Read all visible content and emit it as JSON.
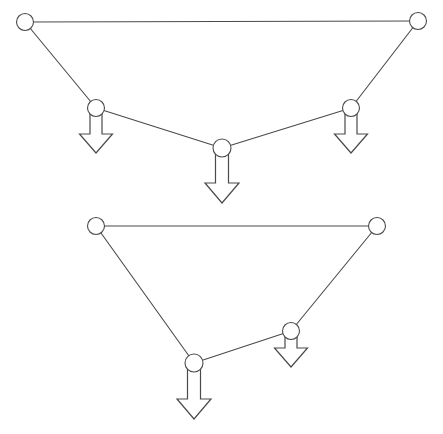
{
  "figure": {
    "background_color": "#ffffff",
    "line_color": "#4a4a4a",
    "joint_fill_color": "#ffffff",
    "arrow_fill_color": "#ffffff",
    "line_width": 1.1,
    "joint_radius": 8.5,
    "canvas": {
      "width": 443,
      "height": 434
    }
  },
  "structures": [
    {
      "name": "upper-truss",
      "label": "Upper truss",
      "joints": [
        {
          "id": "u1",
          "name": "upper-joint-top-left",
          "x": 25,
          "y": 22,
          "r": 8.5,
          "loaded": false
        },
        {
          "id": "u2",
          "name": "upper-joint-left",
          "x": 96,
          "y": 108,
          "r": 8.5,
          "loaded": true
        },
        {
          "id": "u3",
          "name": "upper-joint-center",
          "x": 222,
          "y": 148,
          "r": 9.0,
          "loaded": true
        },
        {
          "id": "u4",
          "name": "upper-joint-right",
          "x": 351,
          "y": 108,
          "r": 8.5,
          "loaded": true
        },
        {
          "id": "u5",
          "name": "upper-joint-top-right",
          "x": 418,
          "y": 21,
          "r": 8.5,
          "loaded": false
        }
      ],
      "members": [
        {
          "name": "upper-member-top-chord",
          "from": "u1",
          "to": "u5"
        },
        {
          "name": "upper-member-left-diagonal",
          "from": "u1",
          "to": "u2"
        },
        {
          "name": "upper-member-left-bottom",
          "from": "u2",
          "to": "u3"
        },
        {
          "name": "upper-member-right-bottom",
          "from": "u3",
          "to": "u4"
        },
        {
          "name": "upper-member-right-diagonal",
          "from": "u4",
          "to": "u5"
        }
      ],
      "loads": [
        {
          "name": "upper-load-left",
          "joint": "u2",
          "x": 96,
          "top": 112,
          "shaft_width": 12,
          "shaft_length": 22,
          "head_width": 33,
          "head_height": 19,
          "direction": "down"
        },
        {
          "name": "upper-load-center",
          "joint": "u3",
          "x": 222,
          "top": 152,
          "shaft_width": 13,
          "shaft_length": 31,
          "head_width": 34,
          "head_height": 20,
          "direction": "down"
        },
        {
          "name": "upper-load-right",
          "joint": "u4",
          "x": 351,
          "top": 112,
          "shaft_width": 12,
          "shaft_length": 22,
          "head_width": 33,
          "head_height": 19,
          "direction": "down"
        }
      ]
    },
    {
      "name": "lower-truss",
      "label": "Lower truss",
      "joints": [
        {
          "id": "l1",
          "name": "lower-joint-top-left",
          "x": 96,
          "y": 226,
          "r": 8.5,
          "loaded": false
        },
        {
          "id": "l2",
          "name": "lower-joint-bottom",
          "x": 194,
          "y": 363,
          "r": 9.0,
          "loaded": true
        },
        {
          "id": "l3",
          "name": "lower-joint-right",
          "x": 291,
          "y": 331,
          "r": 8.5,
          "loaded": true
        },
        {
          "id": "l4",
          "name": "lower-joint-top-right",
          "x": 377,
          "y": 226,
          "r": 8.5,
          "loaded": false
        }
      ],
      "members": [
        {
          "name": "lower-member-top-chord",
          "from": "l1",
          "to": "l4"
        },
        {
          "name": "lower-member-left-diagonal",
          "from": "l1",
          "to": "l2"
        },
        {
          "name": "lower-member-bottom-chord",
          "from": "l2",
          "to": "l3"
        },
        {
          "name": "lower-member-right-diagonal",
          "from": "l3",
          "to": "l4"
        }
      ],
      "loads": [
        {
          "name": "lower-load-center",
          "joint": "l2",
          "x": 194,
          "top": 368,
          "shaft_width": 13,
          "shaft_length": 31,
          "head_width": 34,
          "head_height": 20,
          "direction": "down"
        },
        {
          "name": "lower-load-right",
          "joint": "l3",
          "x": 291,
          "top": 335,
          "shaft_width": 12,
          "shaft_length": 13,
          "head_width": 33,
          "head_height": 19,
          "direction": "down"
        }
      ]
    }
  ]
}
